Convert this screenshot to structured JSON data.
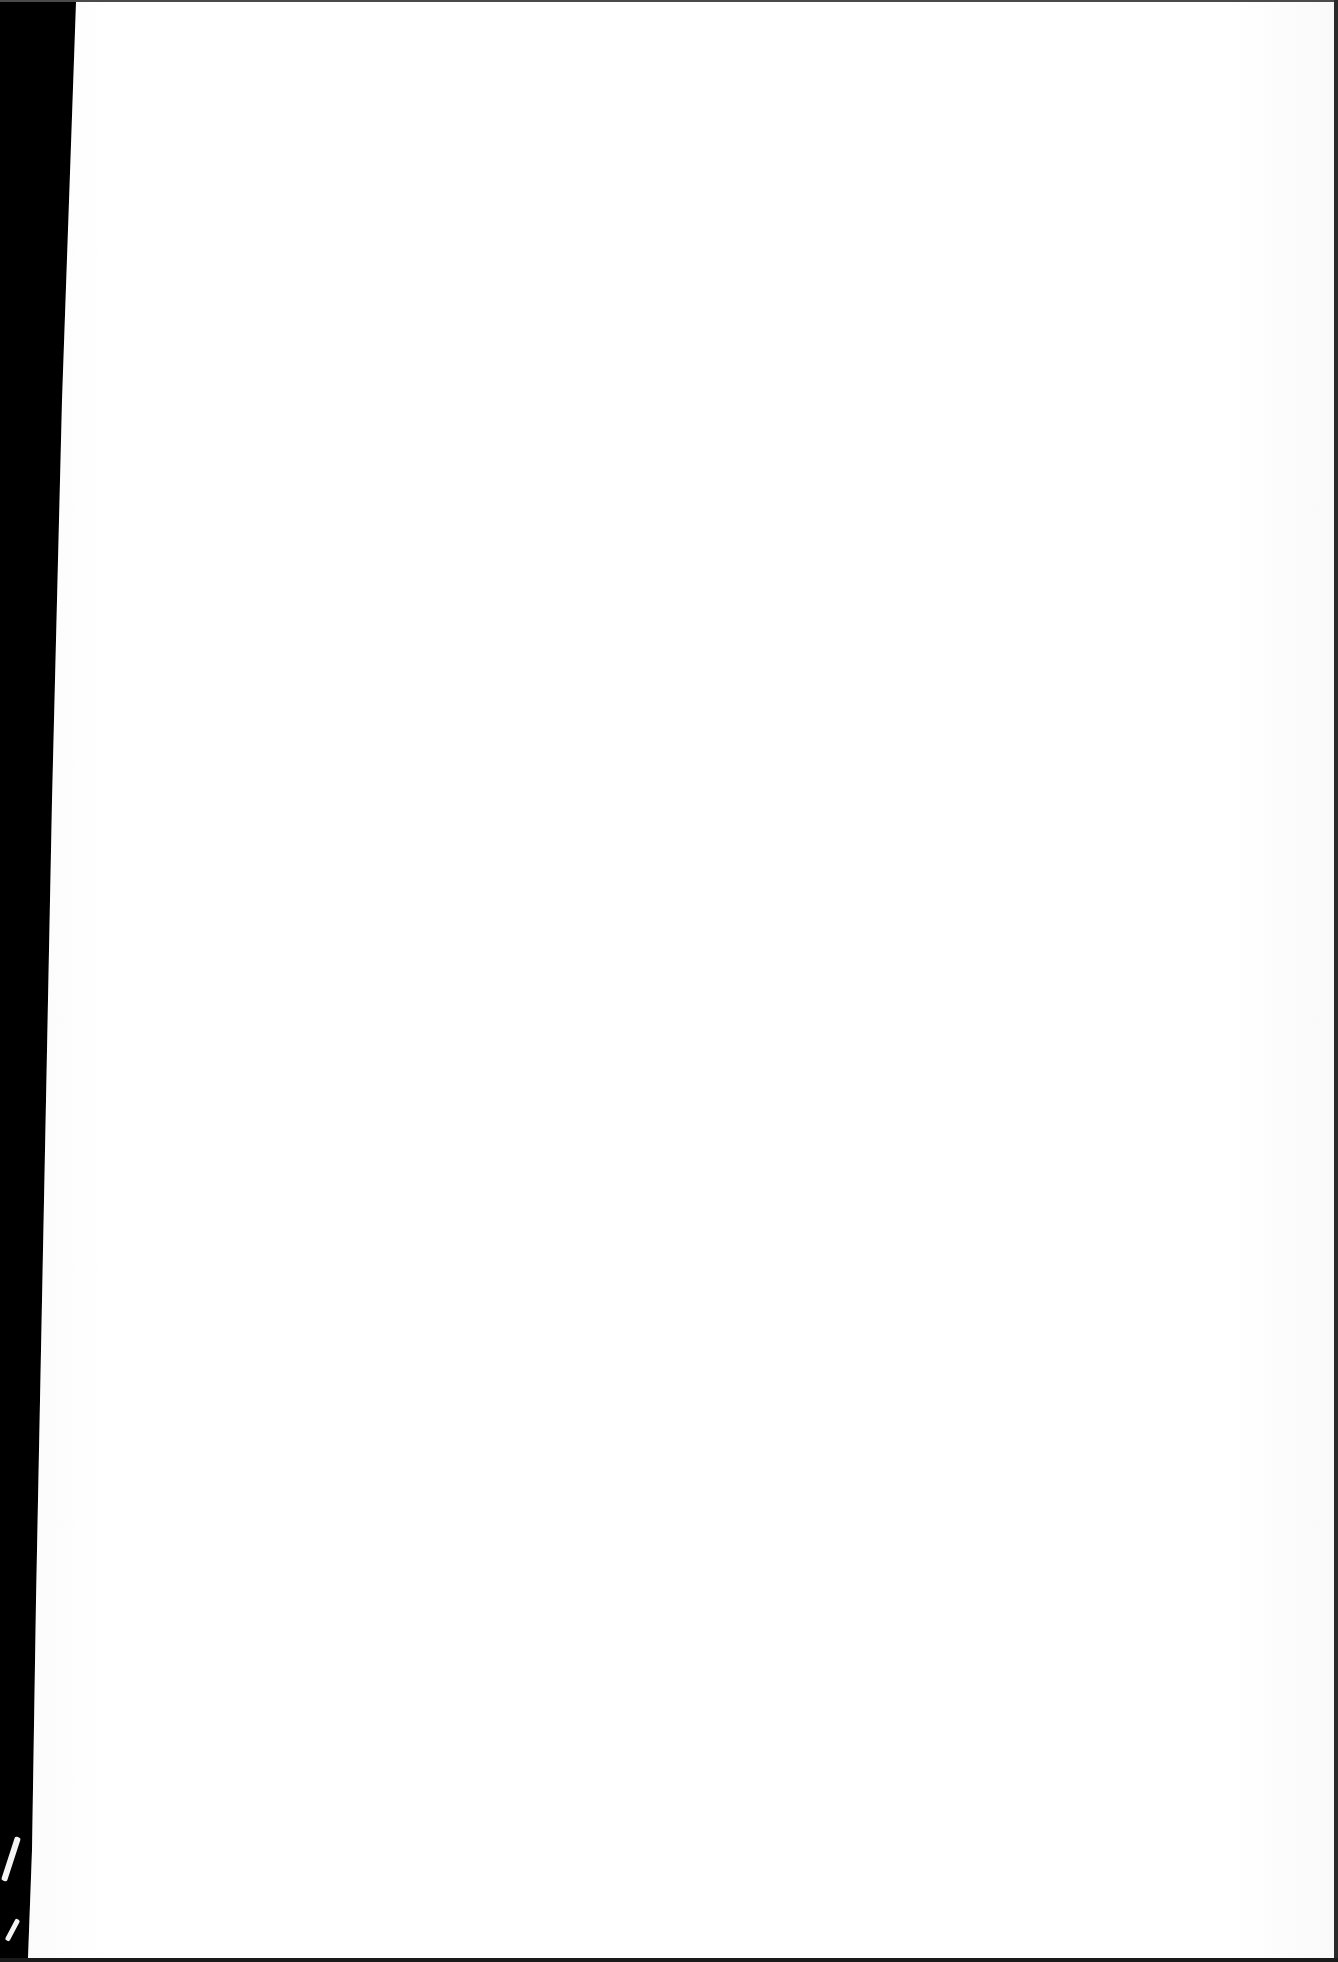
{
  "document": {
    "type": "scanned-page",
    "content": "",
    "is_blank": true
  },
  "colors": {
    "paper": "#ffffff",
    "scanner_background": "#000000",
    "edge_shadow": "#2a2a2a"
  }
}
